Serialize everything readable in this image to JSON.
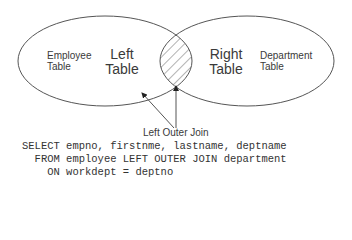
{
  "diagram": {
    "left_circle": {
      "role": "Left",
      "line1": "Left",
      "line2": "Table",
      "table_line1": "Employee",
      "table_line2": "Table"
    },
    "right_circle": {
      "role": "Right",
      "line1": "Right",
      "line2": "Table",
      "table_line1": "Department",
      "table_line2": "Table"
    },
    "join_label": "Left Outer Join",
    "stroke_color": "#555555",
    "hatch_color": "#666666"
  },
  "sql": {
    "lines": [
      "SELECT empno, firstnme, lastname, deptname",
      "  FROM employee LEFT OUTER JOIN department",
      "    ON workdept = deptno"
    ]
  }
}
